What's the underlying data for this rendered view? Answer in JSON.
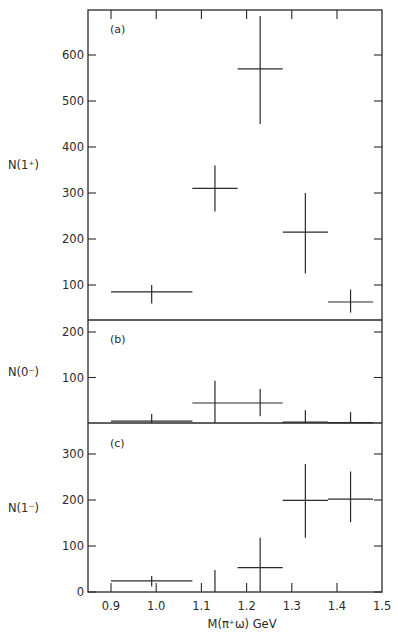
{
  "chart_data": [
    {
      "type": "scatter",
      "panel": "(a)",
      "title": "",
      "xlabel": "M(π⁺ω) GeV",
      "ylabel": "N(1⁺)",
      "ylim": [
        0,
        690
      ],
      "yticks": [
        100,
        200,
        300,
        400,
        500,
        600
      ],
      "xlim": [
        0.85,
        1.5
      ],
      "xticks": [
        0.9,
        1.0,
        1.1,
        1.2,
        1.3,
        1.4,
        1.5
      ],
      "grid": false,
      "points": [
        {
          "x": 0.99,
          "x_lo": 0.9,
          "x_hi": 1.08,
          "y": 85,
          "y_lo": 60,
          "y_hi": 100
        },
        {
          "x": 1.13,
          "x_lo": 1.08,
          "x_hi": 1.18,
          "y": 310,
          "y_lo": 260,
          "y_hi": 360
        },
        {
          "x": 1.23,
          "x_lo": 1.18,
          "x_hi": 1.28,
          "y": 570,
          "y_lo": 450,
          "y_hi": 685
        },
        {
          "x": 1.33,
          "x_lo": 1.28,
          "x_hi": 1.38,
          "y": 215,
          "y_lo": 125,
          "y_hi": 300
        },
        {
          "x": 1.43,
          "x_lo": 1.38,
          "x_hi": 1.48,
          "y": 63,
          "y_lo": 40,
          "y_hi": 90
        }
      ]
    },
    {
      "type": "scatter",
      "panel": "(b)",
      "title": "",
      "xlabel": "M(π⁺ω) GeV",
      "ylabel": "N(0⁻)",
      "ylim": [
        0,
        225
      ],
      "yticks": [
        100,
        200
      ],
      "xlim": [
        0.85,
        1.5
      ],
      "grid": false,
      "points": [
        {
          "x": 0.99,
          "x_lo": 0.9,
          "x_hi": 1.08,
          "y": 4,
          "y_lo": 0,
          "y_hi": 20
        },
        {
          "x": 1.13,
          "x_lo": 1.08,
          "x_hi": 1.18,
          "y": 44,
          "y_lo": 0,
          "y_hi": 93
        },
        {
          "x": 1.23,
          "x_lo": 1.18,
          "x_hi": 1.28,
          "y": 44,
          "y_lo": 15,
          "y_hi": 75
        },
        {
          "x": 1.33,
          "x_lo": 1.28,
          "x_hi": 1.38,
          "y": 2,
          "y_lo": 0,
          "y_hi": 28
        },
        {
          "x": 1.43,
          "x_lo": 1.38,
          "x_hi": 1.48,
          "y": 1,
          "y_lo": 0,
          "y_hi": 24
        }
      ]
    },
    {
      "type": "scatter",
      "panel": "(c)",
      "title": "",
      "xlabel": "M(π⁺ω) GeV",
      "ylabel": "N(1⁻)",
      "ylim": [
        0,
        370
      ],
      "yticks": [
        0,
        100,
        200,
        300
      ],
      "xlim": [
        0.85,
        1.5
      ],
      "xticks": [
        0.9,
        1.0,
        1.1,
        1.2,
        1.3,
        1.4,
        1.5
      ],
      "grid": false,
      "points": [
        {
          "x": 0.99,
          "x_lo": 0.9,
          "x_hi": 1.08,
          "y": 24,
          "y_lo": 12,
          "y_hi": 35
        },
        {
          "x": 1.13,
          "x_lo": 1.13,
          "x_hi": 1.13,
          "y": 0,
          "y_lo": 0,
          "y_hi": 48
        },
        {
          "x": 1.23,
          "x_lo": 1.18,
          "x_hi": 1.28,
          "y": 53,
          "y_lo": 0,
          "y_hi": 118
        },
        {
          "x": 1.33,
          "x_lo": 1.28,
          "x_hi": 1.38,
          "y": 199,
          "y_lo": 118,
          "y_hi": 278
        },
        {
          "x": 1.43,
          "x_lo": 1.38,
          "x_hi": 1.48,
          "y": 202,
          "y_lo": 152,
          "y_hi": 262
        }
      ]
    }
  ],
  "figure": {
    "panel_tags": [
      "(a)",
      "(b)",
      "(c)"
    ],
    "ylabels": [
      "N(1⁺)",
      "N(0⁻)",
      "N(1⁻)"
    ],
    "xlabel": "M(π⁺ω) GeV",
    "x_tick_labels": [
      "0.9",
      "1.0",
      "1.1",
      "1.2",
      "1.3",
      "1.4",
      "1.5"
    ],
    "line_color": "#2a2a2a",
    "background": "#ffffff"
  }
}
